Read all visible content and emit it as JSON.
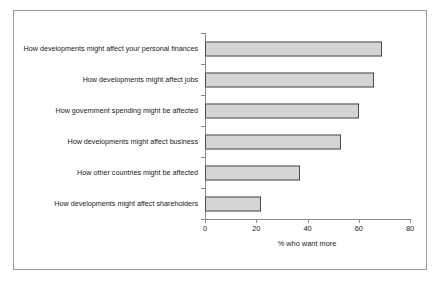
{
  "chart_data": {
    "type": "bar",
    "orientation": "horizontal",
    "title": "",
    "xlabel": "% who want more",
    "ylabel": "",
    "xlim": [
      0,
      80
    ],
    "xticks": [
      0,
      20,
      40,
      60,
      80
    ],
    "xtick_labels": [
      "0",
      "20",
      "40",
      "60",
      "80"
    ],
    "grid": false,
    "legend": false,
    "categories": [
      "How developments might affect your personal finances",
      "How developments might affect jobs",
      "How government spending might be affected",
      "How developments might affect business",
      "How other countries might be affected",
      "How developments might affect shareholders"
    ],
    "values": [
      69,
      66,
      60,
      53,
      37,
      22
    ],
    "bar_fill_color": "#d4d4d4",
    "bar_edge_color": "#4a4a4a",
    "axis_color": "#8a8a8a",
    "frame_color": "#9a9a9a",
    "background_color": "#ffffff"
  }
}
